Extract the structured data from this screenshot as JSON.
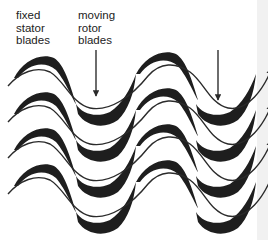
{
  "labels": {
    "stator": "fixed\nstator\nblades",
    "rotor": "moving\nrotor\nblades"
  },
  "diagram": {
    "blade_color": "#1e1e1e",
    "flow_line_color": "#2a2a2a",
    "edge_strip_color": "#f1f1f1",
    "stator_columns": 2,
    "rotor_columns": 2,
    "blades_per_column": 4,
    "arrows": [
      {
        "target": "rotor-column-1",
        "direction": "down"
      },
      {
        "target": "rotor-column-2",
        "direction": "down"
      }
    ],
    "flow_direction": "up-right"
  }
}
